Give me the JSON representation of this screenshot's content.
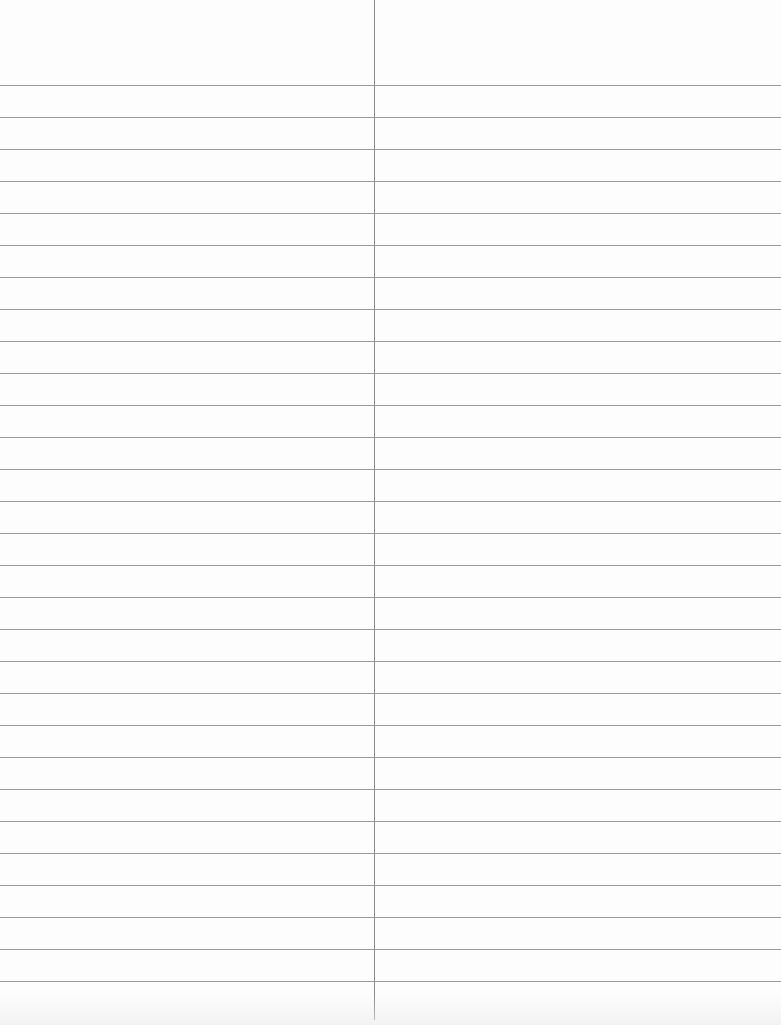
{
  "paper": {
    "type": "ruled-notebook-page",
    "background": "#fdfdfd",
    "line_color": "#9a9a9a",
    "divider_color": "#8a8a8a",
    "first_line_y": 85,
    "line_spacing": 32,
    "line_count": 29,
    "divider_x": 374,
    "columns": [
      {
        "label": ""
      },
      {
        "label": ""
      }
    ]
  }
}
